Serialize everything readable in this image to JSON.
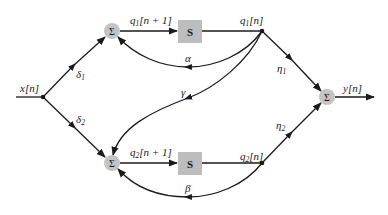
{
  "diagram": {
    "type": "signal-flow / block diagram",
    "colors": {
      "node_fill": "#c4c4c4",
      "box_fill": "#bdbdbd",
      "line": "#1a1a1a",
      "background": "#ffffff"
    },
    "input": {
      "label": "x[n]"
    },
    "output": {
      "label": "y[n]"
    },
    "sum_nodes": [
      {
        "id": "sum_top",
        "symbol": "Σ"
      },
      {
        "id": "sum_bottom",
        "symbol": "Σ"
      },
      {
        "id": "sum_output",
        "symbol": "Σ"
      }
    ],
    "delay_blocks": [
      {
        "id": "s_top",
        "label": "S"
      },
      {
        "id": "s_bottom",
        "label": "S"
      }
    ],
    "signals": {
      "q1_next": "q1[n + 1]",
      "q1": "q1[n]",
      "q2_next": "q2[n + 1]",
      "q2": "q2[n]"
    },
    "gains": {
      "delta1": "δ1",
      "delta2": "δ2",
      "alpha": "α",
      "beta": "β",
      "gamma": "γ",
      "eta1": "η1",
      "eta2": "η2"
    },
    "labels_split": {
      "q1_next": {
        "base": "q",
        "sub": "1",
        "rest": "[n + 1]"
      },
      "q1": {
        "base": "q",
        "sub": "1",
        "rest": "[n]"
      },
      "q2_next": {
        "base": "q",
        "sub": "2",
        "rest": "[n + 1]"
      },
      "q2": {
        "base": "q",
        "sub": "2",
        "rest": "[n]"
      },
      "delta1": {
        "base": "δ",
        "sub": "1"
      },
      "delta2": {
        "base": "δ",
        "sub": "2"
      },
      "eta1": {
        "base": "η",
        "sub": "1"
      },
      "eta2": {
        "base": "η",
        "sub": "2"
      }
    },
    "edges": [
      {
        "from": "x[n]",
        "to": "sum_top",
        "gain": "δ1"
      },
      {
        "from": "x[n]",
        "to": "sum_bottom",
        "gain": "δ2"
      },
      {
        "from": "sum_top",
        "to": "s_top",
        "signal": "q1[n + 1]"
      },
      {
        "from": "s_top",
        "to": "q1[n]"
      },
      {
        "from": "q1[n]",
        "to": "sum_top",
        "gain": "α"
      },
      {
        "from": "q1[n]",
        "to": "sum_bottom",
        "gain": "γ"
      },
      {
        "from": "q1[n]",
        "to": "sum_output",
        "gain": "η1"
      },
      {
        "from": "sum_bottom",
        "to": "s_bottom",
        "signal": "q2[n + 1]"
      },
      {
        "from": "s_bottom",
        "to": "q2[n]"
      },
      {
        "from": "q2[n]",
        "to": "sum_bottom",
        "gain": "β"
      },
      {
        "from": "q2[n]",
        "to": "sum_output",
        "gain": "η2"
      },
      {
        "from": "sum_output",
        "to": "y[n]"
      }
    ]
  }
}
